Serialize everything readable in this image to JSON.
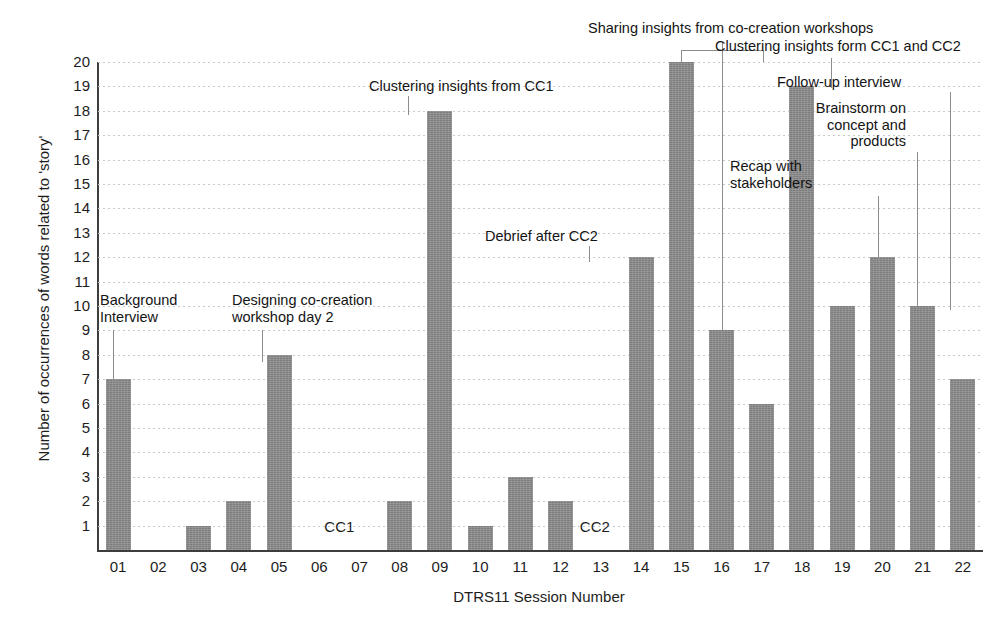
{
  "chart_data": {
    "type": "bar",
    "title": "",
    "xlabel": "DTRS11 Session Number",
    "ylabel": "Number of occurrences of words related to 'story'",
    "categories": [
      "01",
      "02",
      "03",
      "04",
      "05",
      "06",
      "07",
      "08",
      "09",
      "10",
      "11",
      "12",
      "13",
      "14",
      "15",
      "16",
      "17",
      "18",
      "19",
      "20",
      "21",
      "22"
    ],
    "values": [
      7,
      0,
      1,
      2,
      8,
      0,
      0,
      2,
      18,
      1,
      3,
      2,
      0,
      12,
      20,
      9,
      6,
      19,
      10,
      12,
      10,
      7
    ],
    "ylim": [
      0,
      20
    ],
    "yticks": [
      1,
      2,
      3,
      4,
      5,
      6,
      7,
      8,
      9,
      10,
      11,
      12,
      13,
      14,
      15,
      16,
      17,
      18,
      19,
      20
    ],
    "grid": true,
    "legend": "none",
    "bar_color": "#898989",
    "axis_color": "#3d3d3d",
    "grid_color": "#c9c9c9",
    "annotations": [
      {
        "text": "Background\nInterview",
        "target_category": "01",
        "align": "left"
      },
      {
        "text": "Designing co-creation\nworkshop day 2",
        "target_category": "05",
        "align": "left"
      },
      {
        "text": "Clustering insights from CC1",
        "target_category": "09",
        "align": "center"
      },
      {
        "text": "Debrief after CC2",
        "target_category": "14",
        "align": "center"
      },
      {
        "text": "Sharing insights from co-creation workshops",
        "target_category": "15-17",
        "align": "center"
      },
      {
        "text": "Clustering insights form CC1 and CC2",
        "target_category": "18",
        "align": "right"
      },
      {
        "text": "Follow-up interview",
        "target_category": "22",
        "align": "right"
      },
      {
        "text": "Brainstorm on\nconcept and\nproducts",
        "target_category": "21",
        "align": "right"
      },
      {
        "text": "Recap with\nstakeholders",
        "target_category": "20",
        "align": "right"
      }
    ],
    "inline_labels": [
      {
        "text": "CC1",
        "between": "06-07"
      },
      {
        "text": "CC2",
        "between": "13"
      }
    ]
  }
}
